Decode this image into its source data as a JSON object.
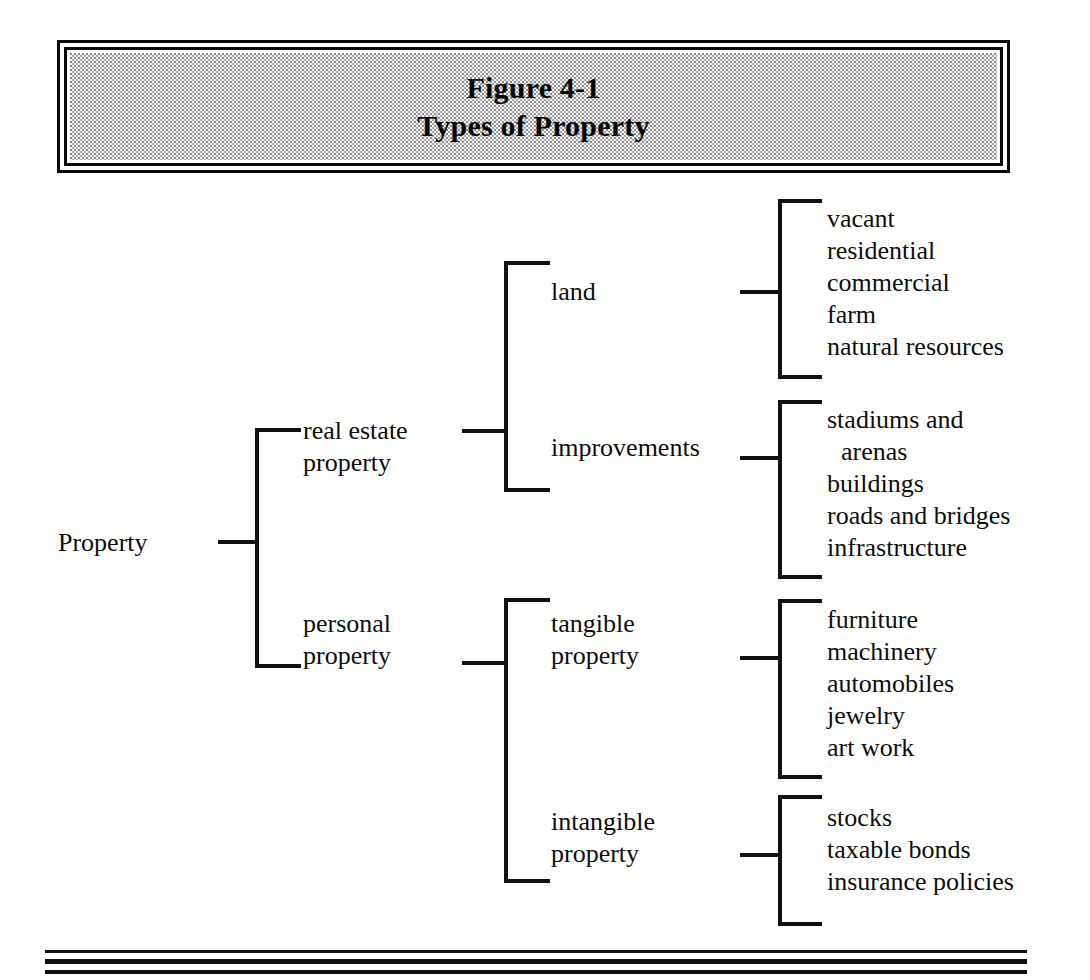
{
  "figure": {
    "title_line1": "Figure 4-1",
    "title_line2": "Types of Property"
  },
  "tree": {
    "root": "Property",
    "level1": [
      {
        "line1": "real estate",
        "line2": "property"
      },
      {
        "line1": "personal",
        "line2": "property"
      }
    ],
    "level2": [
      {
        "line1": "land",
        "line2": ""
      },
      {
        "line1": "improvements",
        "line2": ""
      },
      {
        "line1": "tangible",
        "line2": "property"
      },
      {
        "line1": "intangible",
        "line2": "property"
      }
    ],
    "level3": {
      "land": [
        "vacant",
        "residential",
        "commercial",
        "farm",
        "natural resources"
      ],
      "improvements": [
        "stadiums and",
        "arenas",
        "buildings",
        "roads and bridges",
        "infrastructure"
      ],
      "tangible": [
        "furniture",
        "machinery",
        "automobiles",
        "jewelry",
        "art work"
      ],
      "intangible": [
        "stocks",
        "taxable bonds",
        "insurance policies"
      ]
    }
  },
  "colors": {
    "ink": "#111111",
    "paper": "#ffffff",
    "title_fill": "#f2f2f2"
  }
}
